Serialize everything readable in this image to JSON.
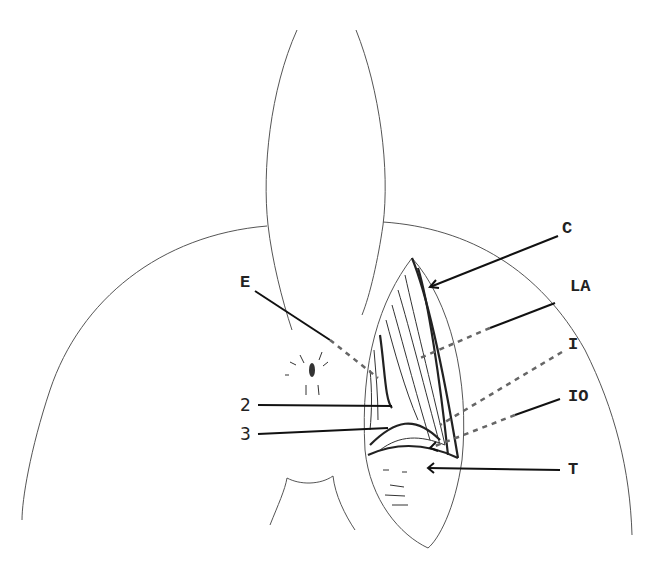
{
  "figure": {
    "type": "anatomical line drawing",
    "labels": [
      {
        "id": "C",
        "text": "C",
        "x": 562,
        "y": 233
      },
      {
        "id": "LA",
        "text": "LA",
        "x": 570,
        "y": 291
      },
      {
        "id": "I",
        "text": "I",
        "x": 568,
        "y": 349
      },
      {
        "id": "IO",
        "text": "IO",
        "x": 568,
        "y": 401
      },
      {
        "id": "T",
        "text": "T",
        "x": 568,
        "y": 474
      },
      {
        "id": "E",
        "text": "E",
        "x": 240,
        "y": 287
      },
      {
        "id": "2",
        "text": "2",
        "x": 240,
        "y": 411
      },
      {
        "id": "3",
        "text": "3",
        "x": 240,
        "y": 440
      }
    ]
  }
}
